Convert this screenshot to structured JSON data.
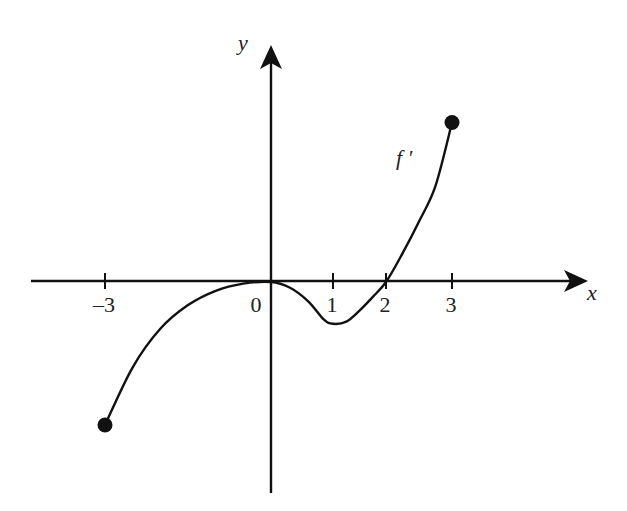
{
  "chart_data": {
    "type": "line",
    "title": "",
    "xlabel": "x",
    "ylabel": "y",
    "xlim": [
      -3.3,
      5.8
    ],
    "grid": false,
    "legend": null,
    "x_tick_labels": [
      "–3",
      "0",
      "1",
      "2",
      "3"
    ],
    "x_ticks": [
      -3,
      0,
      1,
      2,
      3
    ],
    "y_ticks": [],
    "series": [
      {
        "name": "f'",
        "label": "f '",
        "description": "Graph of the derivative f' on the closed interval [-3, 3]",
        "x": [
          -3.0,
          -2.5,
          -2.0,
          -1.5,
          -1.0,
          -0.5,
          0.0,
          0.3,
          0.6,
          0.85,
          1.0,
          1.25,
          1.5,
          1.75,
          2.0,
          2.25,
          2.5,
          2.75,
          3.0
        ],
        "y": [
          -2.6,
          -1.55,
          -0.85,
          -0.42,
          -0.16,
          -0.03,
          0.0,
          -0.1,
          -0.35,
          -0.68,
          -0.76,
          -0.72,
          -0.52,
          -0.27,
          0.0,
          0.52,
          1.1,
          1.75,
          2.9
        ],
        "endpoints": [
          {
            "x": -3,
            "y": -2.6,
            "closed": true
          },
          {
            "x": 3,
            "y": 2.9,
            "closed": true
          }
        ],
        "zeros": [
          0,
          2
        ]
      }
    ],
    "annotations": [
      {
        "text": "f '",
        "near": {
          "x": 2.3,
          "y": 2.2
        }
      }
    ]
  },
  "labels": {
    "x_axis": "x",
    "y_axis": "y",
    "curve": "f '"
  },
  "style": {
    "ink": "#111111",
    "background": "#ffffff"
  }
}
